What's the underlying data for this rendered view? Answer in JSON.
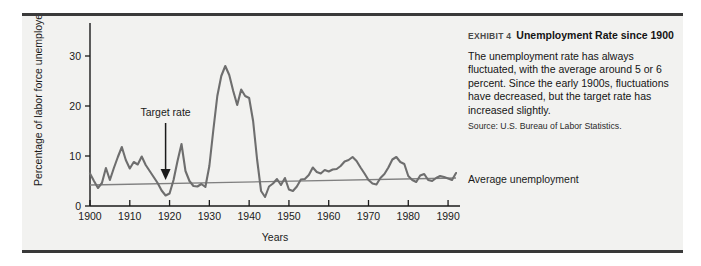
{
  "exhibit": {
    "number_label": "EXHIBIT 4",
    "title": "Unemployment Rate since 1900",
    "body": "The unemployment rate has always fluctuated, with the average around 5 or 6 percent. Since the early 1900s, fluctuations have decreased, but the target rate has increased slightly.",
    "source": "Source: U.S. Bureau of Labor Statistics."
  },
  "colors": {
    "panel_background": "#f2f2f0",
    "panel_border": "#3a3a3a",
    "series_line": "#6e6e6e",
    "average_line": "#808080",
    "axis": "#1a1a1a",
    "text": "#141414"
  },
  "chart_data": {
    "type": "line",
    "title": "Unemployment Rate since 1900",
    "xlabel": "Years",
    "ylabel": "Percentage of labor force unemployed",
    "xlim": [
      1900,
      1993
    ],
    "ylim": [
      0,
      34
    ],
    "xticks": [
      1900,
      1910,
      1920,
      1930,
      1940,
      1950,
      1960,
      1970,
      1980,
      1990
    ],
    "xticklabels": [
      "1900",
      "1910",
      "1920",
      "1930",
      "1940",
      "1950",
      "1960",
      "1970",
      "1980",
      "1990"
    ],
    "yticks": [
      0,
      10,
      20,
      30
    ],
    "yticklabels": [
      "0",
      "10",
      "20",
      "30"
    ],
    "grid": false,
    "legend": false,
    "annotations": [
      {
        "name": "target-rate",
        "text": "Target rate",
        "x": 1919,
        "y": 18.0,
        "arrow_to_x": 1919,
        "arrow_to_y": 5.2
      },
      {
        "name": "average-unemployment",
        "text": "Average unemployment",
        "x": 1996,
        "y": 5.4
      }
    ],
    "series": [
      {
        "name": "Unemployment rate",
        "color": "#6e6e6e",
        "x": [
          1900,
          1901,
          1902,
          1903,
          1904,
          1905,
          1906,
          1907,
          1908,
          1909,
          1910,
          1911,
          1912,
          1913,
          1914,
          1915,
          1916,
          1917,
          1918,
          1919,
          1920,
          1921,
          1922,
          1923,
          1924,
          1925,
          1926,
          1927,
          1928,
          1929,
          1930,
          1931,
          1932,
          1933,
          1934,
          1935,
          1936,
          1937,
          1938,
          1939,
          1940,
          1941,
          1942,
          1943,
          1944,
          1945,
          1946,
          1947,
          1948,
          1949,
          1950,
          1951,
          1952,
          1953,
          1954,
          1955,
          1956,
          1957,
          1958,
          1959,
          1960,
          1961,
          1962,
          1963,
          1964,
          1965,
          1966,
          1967,
          1968,
          1969,
          1970,
          1971,
          1972,
          1973,
          1974,
          1975,
          1976,
          1977,
          1978,
          1979,
          1980,
          1981,
          1982,
          1983,
          1984,
          1985,
          1986,
          1987,
          1988,
          1989,
          1990,
          1991,
          1992
        ],
        "y": [
          6.5,
          5.0,
          3.6,
          4.6,
          7.6,
          5.2,
          7.6,
          9.8,
          11.8,
          9.2,
          7.5,
          8.8,
          8.3,
          9.9,
          8.2,
          7.0,
          5.8,
          4.6,
          3.1,
          2.1,
          2.5,
          5.2,
          9.0,
          12.4,
          7.0,
          5.0,
          4.0,
          3.9,
          4.4,
          3.8,
          8.0,
          15.2,
          22.0,
          26.0,
          28.0,
          26.2,
          23.0,
          20.2,
          23.3,
          22.0,
          21.6,
          17.0,
          9.3,
          3.0,
          1.8,
          3.9,
          4.5,
          5.4,
          4.2,
          5.6,
          3.3,
          3.0,
          3.9,
          5.3,
          5.4,
          6.2,
          7.7,
          6.8,
          6.5,
          7.2,
          6.9,
          7.3,
          7.4,
          8.0,
          8.9,
          9.2,
          9.8,
          9.0,
          7.7,
          6.5,
          5.2,
          4.5,
          4.3,
          5.6,
          6.4,
          7.7,
          9.3,
          9.8,
          8.8,
          8.4,
          6.0,
          5.2,
          4.8,
          6.1,
          6.4,
          5.2,
          5.0,
          5.6,
          6.0,
          5.8,
          5.5,
          5.2,
          6.6
        ]
      },
      {
        "name": "Average unemployment",
        "color": "#808080",
        "style": "trend",
        "x": [
          1900,
          1992
        ],
        "y": [
          4.2,
          5.6
        ]
      }
    ]
  }
}
